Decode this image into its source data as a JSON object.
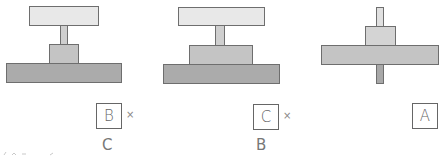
{
  "figures": [
    {
      "id": "figure-1",
      "parts": [
        {
          "name": "top-plate",
          "x": 29,
          "y": 6,
          "w": 70,
          "h": 20,
          "fill": "#e8e8e8"
        },
        {
          "name": "stem",
          "x": 60,
          "y": 25,
          "w": 8,
          "h": 20,
          "fill": "#cfcfcf"
        },
        {
          "name": "middle-block",
          "x": 49,
          "y": 44,
          "w": 30,
          "h": 20,
          "fill": "#c4c4c4"
        },
        {
          "name": "bottom-plate",
          "x": 6,
          "y": 63,
          "w": 116,
          "h": 20,
          "fill": "#ababab"
        }
      ],
      "answer_box": {
        "label": "B",
        "x": 96,
        "y": 103
      },
      "mark": "×",
      "correction": "C"
    },
    {
      "id": "figure-2",
      "parts": [
        {
          "name": "top-plate",
          "x": 178,
          "y": 7,
          "w": 87,
          "h": 19,
          "fill": "#e8e8e8"
        },
        {
          "name": "stem",
          "x": 215,
          "y": 25,
          "w": 10,
          "h": 21,
          "fill": "#cfcfcf"
        },
        {
          "name": "middle-block",
          "x": 189,
          "y": 45,
          "w": 64,
          "h": 20,
          "fill": "#c4c4c4"
        },
        {
          "name": "bottom-plate",
          "x": 163,
          "y": 64,
          "w": 117,
          "h": 20,
          "fill": "#ababab"
        }
      ],
      "answer_box": {
        "label": "C",
        "x": 253,
        "y": 104
      },
      "mark": "×",
      "correction": "B"
    },
    {
      "id": "figure-3",
      "parts": [
        {
          "name": "top-stem",
          "x": 376,
          "y": 7,
          "w": 8,
          "h": 20,
          "fill": "#e0e0e0"
        },
        {
          "name": "middle-block",
          "x": 365,
          "y": 26,
          "w": 31,
          "h": 20,
          "fill": "#d4d4d4"
        },
        {
          "name": "plate",
          "x": 321,
          "y": 45,
          "w": 118,
          "h": 20,
          "fill": "#c4c4c4"
        },
        {
          "name": "bottom-stem",
          "x": 376,
          "y": 64,
          "w": 8,
          "h": 20,
          "fill": "#a8a8a8"
        }
      ],
      "answer_box": {
        "label": "A",
        "x": 412,
        "y": 103
      },
      "mark": "",
      "correction": ""
    }
  ]
}
